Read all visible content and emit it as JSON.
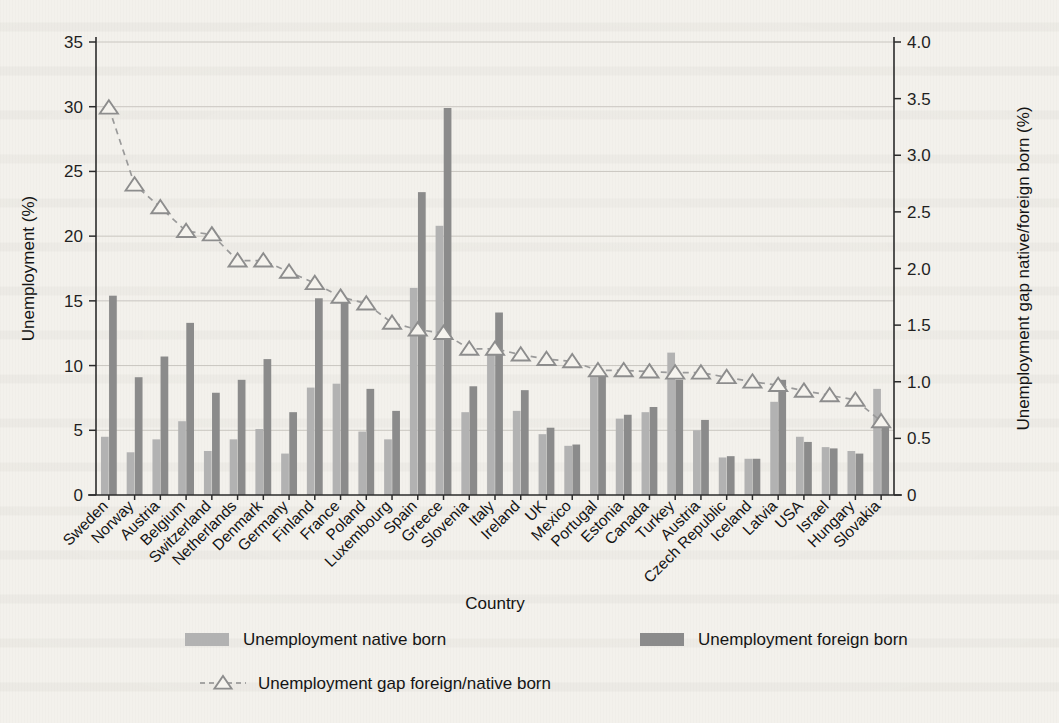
{
  "chart_data": {
    "type": "bar",
    "title": "",
    "subtitle": "",
    "xlabel": "Country",
    "ylabel": "Unemployment (%)",
    "y2label": "Unemployment gap native/foreign born (%)",
    "ylim": [
      0,
      35
    ],
    "y2lim": [
      0,
      4.0
    ],
    "ytick_labels": [
      "0",
      "5",
      "10",
      "15",
      "20",
      "25",
      "30",
      "35"
    ],
    "ytick_values": [
      0,
      5,
      10,
      15,
      20,
      25,
      30,
      35
    ],
    "y2tick_labels": [
      "0",
      "0.5",
      "1.0",
      "1.5",
      "2.0",
      "2.5",
      "3.0",
      "3.5",
      "4.0"
    ],
    "y2tick_values": [
      0,
      0.5,
      1.0,
      1.5,
      2.0,
      2.5,
      3.0,
      3.5,
      4.0
    ],
    "grid": true,
    "legend_position": "bottom",
    "categories": [
      "Sweden",
      "Norway",
      "Austria",
      "Belgium",
      "Switzerland",
      "Netherlands",
      "Denmark",
      "Germany",
      "Finland",
      "France",
      "Poland",
      "Luxembourg",
      "Spain",
      "Greece",
      "Slovenia",
      "Italy",
      "Ireland",
      "UK",
      "Mexico",
      "Portugal",
      "Estonia",
      "Canada",
      "Turkey",
      "Austria",
      "Czech Republic",
      "Iceland",
      "Latvia",
      "USA",
      "Israel",
      "Hungary",
      "Slovakia"
    ],
    "series": [
      {
        "name": "Unemployment native born",
        "color": "#b2b2b2",
        "axis": "left",
        "values": [
          4.5,
          3.3,
          4.3,
          5.7,
          3.4,
          4.3,
          5.1,
          3.2,
          8.3,
          8.6,
          4.9,
          4.3,
          16.0,
          20.8,
          6.4,
          10.9,
          6.5,
          4.7,
          3.8,
          9.1,
          5.9,
          6.4,
          11.0,
          5.0,
          2.9,
          2.8,
          7.2,
          4.5,
          3.7,
          3.4,
          8.2
        ]
      },
      {
        "name": "Unemployment foreign born",
        "color": "#8b8b8b",
        "axis": "left",
        "values": [
          15.4,
          9.1,
          10.7,
          13.3,
          7.9,
          8.9,
          10.5,
          6.4,
          15.2,
          15.1,
          8.2,
          6.5,
          23.4,
          29.9,
          8.4,
          14.1,
          8.1,
          5.2,
          3.9,
          9.2,
          6.2,
          6.8,
          8.9,
          5.8,
          3.0,
          2.8,
          8.9,
          4.1,
          3.6,
          3.2,
          5.4
        ]
      }
    ],
    "line_series": {
      "name": "Unemployment gap foreign/native born",
      "color": "#8d8d8d",
      "axis": "right",
      "marker": "triangle-up-open",
      "linestyle": "dashed",
      "values": [
        3.42,
        2.74,
        2.54,
        2.33,
        2.3,
        2.07,
        2.07,
        1.97,
        1.87,
        1.75,
        1.69,
        1.52,
        1.46,
        1.43,
        1.29,
        1.29,
        1.24,
        1.2,
        1.18,
        1.1,
        1.1,
        1.09,
        1.08,
        1.08,
        1.04,
        1.0,
        0.97,
        0.92,
        0.88,
        0.84,
        0.65
      ]
    },
    "legend": [
      {
        "label": "Unemployment native born",
        "type": "swatch",
        "color": "#b2b2b2"
      },
      {
        "label": "Unemployment foreign born",
        "type": "swatch",
        "color": "#8b8b8b"
      },
      {
        "label": "Unemployment gap foreign/native born",
        "type": "dashed-marker",
        "color": "#8d8d8d"
      }
    ]
  }
}
